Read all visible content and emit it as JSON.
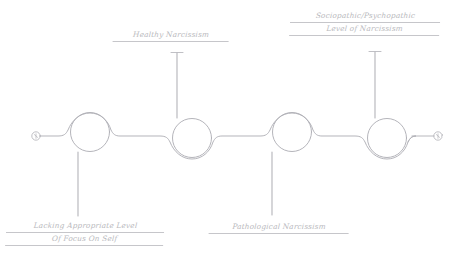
{
  "diagram": {
    "stroke_color": "#b0b0b6",
    "text_color": "#b9b9bd",
    "background_color": "#ffffff",
    "nodes": [
      {
        "id": "node-1",
        "index": 1,
        "loop": "over",
        "stem": "down",
        "label_id": "label-lacking"
      },
      {
        "id": "node-2",
        "index": 2,
        "loop": "under",
        "stem": "up",
        "label_id": "label-healthy"
      },
      {
        "id": "node-3",
        "index": 3,
        "loop": "over",
        "stem": "down",
        "label_id": "label-patho"
      },
      {
        "id": "node-4",
        "index": 4,
        "loop": "under",
        "stem": "up",
        "label_id": "label-socio"
      }
    ],
    "endpoints": [
      {
        "id": "endpoint-left",
        "side": "left"
      },
      {
        "id": "endpoint-right",
        "side": "right"
      }
    ],
    "labels": {
      "lacking": {
        "line1": "Lacking Appropriate Level",
        "line2": "Of Focus On Self"
      },
      "healthy": {
        "line1": "Healthy Narcissism"
      },
      "pathological": {
        "line1": "Pathological Narcissism"
      },
      "sociopathic": {
        "line1": "Sociopathic/Psychopathic",
        "line2": "Level of Narcissism"
      }
    }
  }
}
